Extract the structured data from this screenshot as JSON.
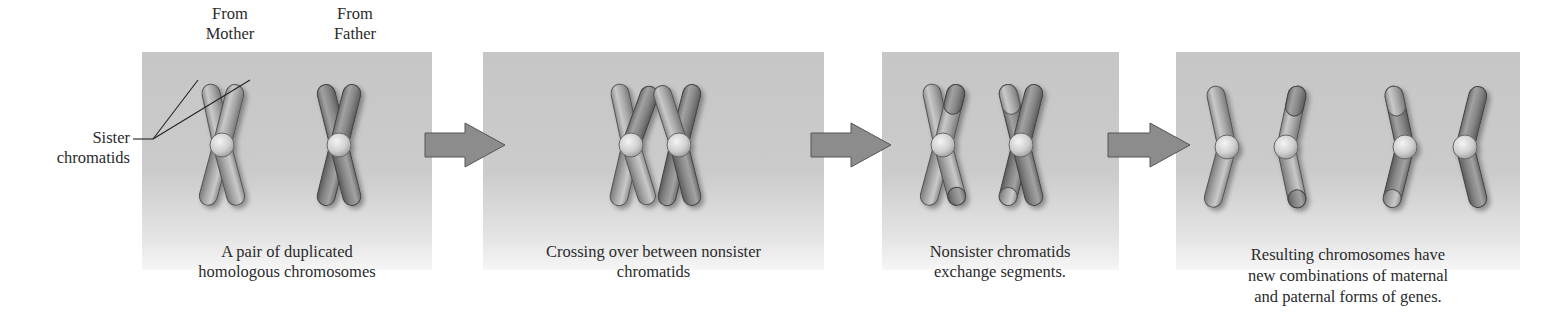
{
  "figure": {
    "parent_labels": {
      "mother": "From\nMother",
      "father": "From\nFather",
      "mother_lines": [
        "From",
        "Mother"
      ],
      "father_lines": [
        "From",
        "Father"
      ]
    },
    "annotation": {
      "lines": [
        "Sister",
        "chromatids"
      ]
    },
    "panels": [
      {
        "id": "duplicated-pair",
        "caption_lines": [
          "A pair of duplicated",
          "homologous chromosomes"
        ]
      },
      {
        "id": "crossing-over",
        "caption_lines": [
          "Crossing over between nonsister",
          "chromatids"
        ]
      },
      {
        "id": "segment-exchange",
        "caption_lines": [
          "Nonsister chromatids",
          "exchange segments."
        ]
      },
      {
        "id": "recombinant-chromosomes",
        "caption_lines": [
          "Resulting chromosomes have",
          "new combinations of maternal",
          "and paternal forms of genes."
        ]
      }
    ],
    "arrows": [
      {
        "from": "duplicated-pair",
        "to": "crossing-over"
      },
      {
        "from": "crossing-over",
        "to": "segment-exchange"
      },
      {
        "from": "segment-exchange",
        "to": "recombinant-chromosomes"
      }
    ],
    "colors": {
      "panel_bg": "#c6c6c6",
      "maternal": "#a9a9a9",
      "paternal": "#8a8a8a",
      "centromere": "#d8d8d8",
      "arrow": "#8c8c8c",
      "text": "#2b2b2b"
    }
  }
}
